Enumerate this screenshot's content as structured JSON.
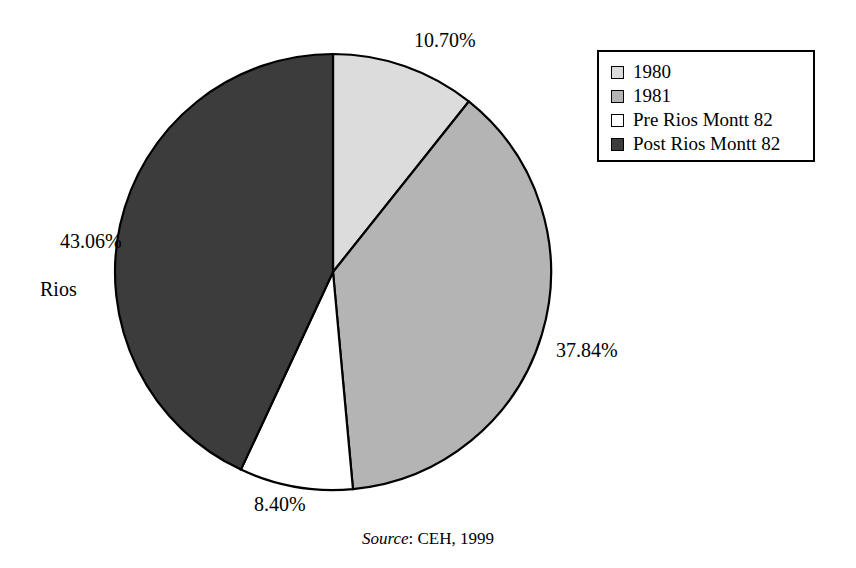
{
  "figure": {
    "width": 856,
    "height": 568,
    "background": "#ffffff"
  },
  "chart_data": {
    "type": "pie",
    "title": "",
    "labels": [
      "1980",
      "1981",
      "Pre Rios Montt 82",
      "Post Rios Montt 82"
    ],
    "values": [
      10.7,
      37.84,
      8.4,
      43.06
    ],
    "value_labels": [
      "10.70%",
      "37.84%",
      "8.40%",
      "43.06%"
    ],
    "annotations": [
      "Rios"
    ],
    "units": "percent",
    "start_angle_deg": 0,
    "direction": "clockwise",
    "colors": [
      "#dcdcdc",
      "#b4b4b4",
      "#ffffff",
      "#3c3c3c"
    ],
    "stroke": "#000000",
    "legend_position": "top-right",
    "grid": false,
    "source": "Source: CEH, 1999"
  },
  "pie": {
    "center_x": 333,
    "center_y": 272,
    "radius": 218,
    "slices": [
      {
        "key": "1980",
        "percent": 10.7,
        "label": "10.70%",
        "color": "#dcdcdc"
      },
      {
        "key": "1981",
        "percent": 37.84,
        "label": "37.84%",
        "color": "#b4b4b4"
      },
      {
        "key": "pre",
        "percent": 8.4,
        "label": "8.40%",
        "color": "#ffffff"
      },
      {
        "key": "post",
        "percent": 43.06,
        "label": "43.06%",
        "color": "#3c3c3c"
      }
    ]
  },
  "labels": {
    "slice_1980": "10.70%",
    "slice_1981": "37.84%",
    "slice_pre": "8.40%",
    "slice_post": "43.06%",
    "slice_post_line2": "Rios"
  },
  "legend": {
    "items": [
      {
        "label": "1980",
        "swatch": "light-gray-swatch",
        "color": "#dcdcdc"
      },
      {
        "label": "1981",
        "swatch": "medium-gray-swatch",
        "color": "#b4b4b4"
      },
      {
        "label": "Pre Rios Montt 82",
        "swatch": "white-swatch",
        "color": "#ffffff"
      },
      {
        "label": "Post Rios Montt 82",
        "swatch": "dark-gray-swatch",
        "color": "#3c3c3c"
      }
    ]
  },
  "caption": {
    "source_word": "Source",
    "source_rest": ": CEH, 1999"
  }
}
